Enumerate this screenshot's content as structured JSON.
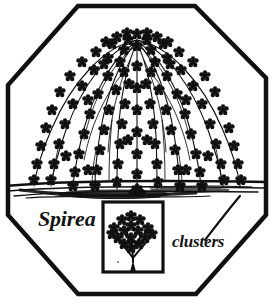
{
  "illustration": {
    "subject": "Spirea shrub",
    "style": "black-and-white pen-and-ink botanical line drawing",
    "frame_shape": "octagon",
    "background_color": "#ffffff",
    "ink_color": "#101010",
    "labels": {
      "plant_name": "Spirea",
      "feature_name": "clusters"
    },
    "inset": {
      "name": "flower-cluster-detail",
      "border_color": "#101010"
    },
    "elements": {
      "shrub": "arching fountain-form branches laden with flower clusters",
      "ground": "sketchy horizontal ground strokes",
      "callout": "diagonal leader line from clusters label to shrub"
    }
  }
}
